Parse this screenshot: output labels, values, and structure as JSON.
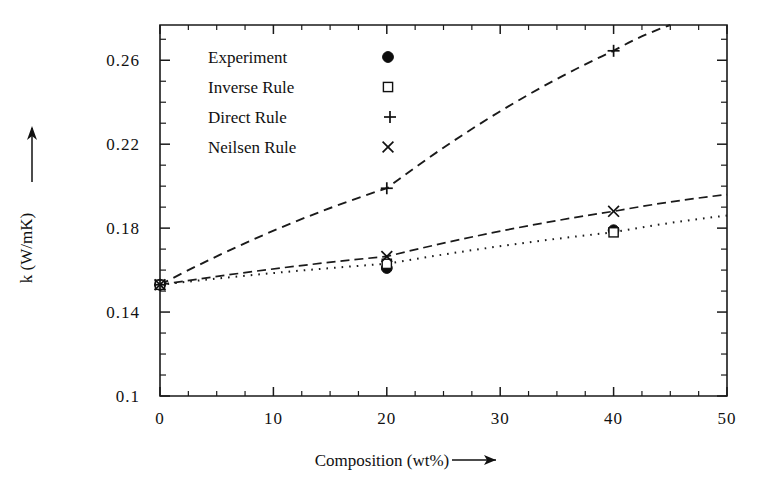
{
  "chart_data": {
    "type": "scatter",
    "title": "",
    "xlabel": "Composition (wt%)",
    "ylabel": "k (W/mK)",
    "xlim": [
      0,
      50
    ],
    "ylim": [
      0.1,
      0.2768
    ],
    "xticks": [
      0,
      10,
      20,
      30,
      40,
      50
    ],
    "xticklabels": [
      "0",
      "10",
      "20",
      "30",
      "40",
      "50"
    ],
    "xminor_step": 2.5,
    "yticks": [
      0.1,
      0.14,
      0.18,
      0.22,
      0.26
    ],
    "yticklabels": [
      "0.1",
      "0.14",
      "0.18",
      "0.22",
      "0.26"
    ],
    "yminor_step": 0.01,
    "grid": false,
    "legend_position": "upper-left-inside",
    "series": [
      {
        "name": "Experiment",
        "marker": "filled-circle",
        "line": "none",
        "x": [
          0,
          20,
          40
        ],
        "y": [
          0.153,
          0.161,
          0.179
        ]
      },
      {
        "name": "Inverse Rule",
        "marker": "open-square",
        "line": "dotted",
        "x": [
          0,
          20,
          40,
          50
        ],
        "y": [
          0.153,
          0.163,
          0.178,
          0.186
        ]
      },
      {
        "name": "Direct Rule",
        "marker": "plus",
        "line": "dashed",
        "x": [
          0,
          20,
          40,
          45
        ],
        "y": [
          0.153,
          0.199,
          0.2645,
          0.2768
        ]
      },
      {
        "name": "Neilsen Rule",
        "marker": "cross",
        "line": "dash-dot",
        "x": [
          0,
          20,
          40,
          50
        ],
        "y": [
          0.153,
          0.1665,
          0.188,
          0.196
        ]
      }
    ]
  },
  "legend": {
    "entries": [
      {
        "label": "Experiment",
        "glyph": "filled-circle"
      },
      {
        "label": "Inverse Rule",
        "glyph": "open-square"
      },
      {
        "label": "Direct Rule",
        "glyph": "plus"
      },
      {
        "label": "Neilsen Rule",
        "glyph": "cross"
      }
    ]
  },
  "axes": {
    "x_axis_title": "Composition (wt%)",
    "x_axis_arrow": "right-arrow",
    "y_axis_title": "k (W/mK)",
    "y_axis_arrow": "up-arrow"
  },
  "colors": {
    "ink": "#111111",
    "background": "#ffffff"
  }
}
